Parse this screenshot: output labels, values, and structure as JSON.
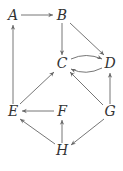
{
  "diagram": {
    "type": "directed-graph",
    "nodes": [
      {
        "id": "A",
        "label": "A",
        "x": 13,
        "y": 16
      },
      {
        "id": "B",
        "label": "B",
        "x": 62,
        "y": 16
      },
      {
        "id": "C",
        "label": "C",
        "x": 62,
        "y": 64
      },
      {
        "id": "D",
        "label": "D",
        "x": 110,
        "y": 64
      },
      {
        "id": "E",
        "label": "E",
        "x": 13,
        "y": 112
      },
      {
        "id": "F",
        "label": "F",
        "x": 62,
        "y": 112
      },
      {
        "id": "G",
        "label": "G",
        "x": 110,
        "y": 112
      },
      {
        "id": "H",
        "label": "H",
        "x": 62,
        "y": 151
      }
    ],
    "edges": [
      {
        "from": "A",
        "to": "B"
      },
      {
        "from": "B",
        "to": "C"
      },
      {
        "from": "B",
        "to": "D"
      },
      {
        "from": "C",
        "to": "D",
        "curve": "upper"
      },
      {
        "from": "D",
        "to": "C",
        "curve": "lower"
      },
      {
        "from": "E",
        "to": "A"
      },
      {
        "from": "E",
        "to": "C"
      },
      {
        "from": "G",
        "to": "C"
      },
      {
        "from": "G",
        "to": "D"
      },
      {
        "from": "F",
        "to": "E"
      },
      {
        "from": "H",
        "to": "E"
      },
      {
        "from": "H",
        "to": "F"
      },
      {
        "from": "G",
        "to": "H"
      }
    ]
  },
  "labels": {
    "A": "A",
    "B": "B",
    "C": "C",
    "D": "D",
    "E": "E",
    "F": "F",
    "G": "G",
    "H": "H"
  },
  "colors": {
    "edge": "#666666",
    "label": "#333333",
    "background": "#ffffff"
  }
}
